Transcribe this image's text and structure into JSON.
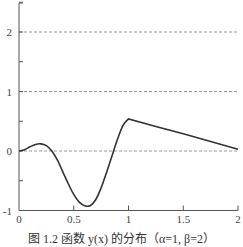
{
  "chart_data": {
    "type": "line",
    "title": "",
    "caption": "图 1.2  函数 y(x) 的分布（α=1, β=2）",
    "xlabel": "",
    "ylabel": "",
    "xlim": [
      0,
      2
    ],
    "ylim": [
      -1,
      2.5
    ],
    "x_ticks": [
      "0",
      "0.5",
      "1",
      "1.5",
      "2"
    ],
    "y_ticks": [
      "-1",
      "0",
      "1",
      "2"
    ],
    "grid": {
      "horizontal_dashed_at": [
        0,
        1,
        2
      ]
    },
    "series": [
      {
        "name": "y(x)",
        "color": "#333333",
        "x": [
          0,
          0.05,
          0.1,
          0.15,
          0.2,
          0.25,
          0.3,
          0.35,
          0.4,
          0.45,
          0.5,
          0.55,
          0.6,
          0.65,
          0.7,
          0.75,
          0.8,
          0.85,
          0.9,
          0.95,
          1.0,
          1.25,
          1.5,
          1.75,
          2.0
        ],
        "values": [
          0,
          0.02,
          0.07,
          0.11,
          0.12,
          0.09,
          0.0,
          -0.15,
          -0.35,
          -0.55,
          -0.73,
          -0.86,
          -0.92,
          -0.92,
          -0.82,
          -0.62,
          -0.36,
          -0.08,
          0.2,
          0.43,
          0.54,
          0.41,
          0.29,
          0.16,
          0.03
        ]
      }
    ]
  }
}
